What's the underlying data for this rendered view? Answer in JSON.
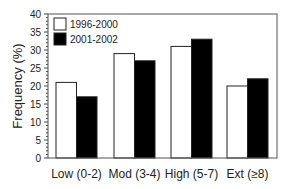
{
  "chart_data": {
    "type": "bar",
    "title": "",
    "xlabel": "",
    "ylabel": "Frequency (%)",
    "ylim": [
      0,
      40
    ],
    "yticks": [
      0,
      5,
      10,
      15,
      20,
      25,
      30,
      35,
      40
    ],
    "grid": false,
    "legend_position": "upper-left",
    "categories": [
      "Low (0-2)",
      "Mod (3-4)",
      "High (5-7)",
      "Ext (≥8)"
    ],
    "series": [
      {
        "name": "1996-2000",
        "color": "#ffffff",
        "values": [
          21,
          29,
          31,
          20
        ]
      },
      {
        "name": "2001-2002",
        "color": "#000000",
        "values": [
          17,
          27,
          33,
          22
        ]
      }
    ]
  }
}
